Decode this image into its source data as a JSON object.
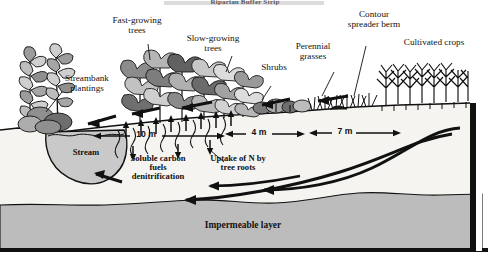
{
  "figure": {
    "title": "Riparian Buffer Strip",
    "domain": "diagram",
    "bg_color": "#ffffff",
    "ink_color": "#111111",
    "soil_color": "#f2f1ee",
    "impermeable_color": "#b9b9b9",
    "water_color": "#c9c9c9"
  },
  "callouts": {
    "streambank_plantings": "Streambank\nplantings",
    "fast_growing_trees": "Fast-growing\ntrees",
    "slow_growing_trees": "Slow-growing\ntrees",
    "shrubs": "Shrubs",
    "perennial_grasses": "Perennial\ngrasses",
    "contour_spreader_berm": "Contour\nspreader berm",
    "cultivated_crops": "Cultivated crops"
  },
  "inline_labels": {
    "stream": "Stream",
    "soluble_carbon": "Soluble carbon\nfuels\ndenitrification",
    "uptake_of_n": "Uptake of N by\ntree roots",
    "impermeable_layer": "Impermeable layer"
  },
  "measurements": [
    {
      "label": "10 m",
      "zone": "tree zone",
      "value": 10,
      "unit": "m"
    },
    {
      "label": "4 m",
      "zone": "shrub zone",
      "value": 4,
      "unit": "m"
    },
    {
      "label": "7 m",
      "zone": "grass zone",
      "value": 7,
      "unit": "m"
    }
  ],
  "zones": [
    {
      "name": "streambank plantings",
      "order": 1
    },
    {
      "name": "fast-growing trees",
      "order": 2
    },
    {
      "name": "slow-growing trees",
      "order": 3
    },
    {
      "name": "shrubs",
      "order": 4
    },
    {
      "name": "perennial grasses",
      "order": 5
    },
    {
      "name": "cultivated crops",
      "order": 6
    }
  ],
  "flows": {
    "surface_runoff": "surface runoff arrows pointing toward stream",
    "groundwater": "subsurface groundwater flow arrows toward stream",
    "root_uptake": "upward arrows from root zone"
  }
}
